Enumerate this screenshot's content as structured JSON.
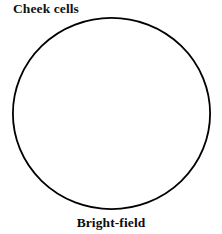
{
  "figure": {
    "canvas": {
      "width": 222,
      "height": 234,
      "background_color": "#ffffff"
    },
    "top_label": "Cheek cells",
    "bottom_label": "Bright-field",
    "specimen": {
      "name": "cheek cells",
      "illumination_technique": "Bright-field"
    },
    "field_of_view": {
      "shape": "circle",
      "stroke_color": "#000000",
      "fill_color": "#ffffff",
      "stroke_width_px": 1.8,
      "center_x": 111.5,
      "center_y": 113.5,
      "radius_x": 99.5,
      "radius_y": 96.5,
      "left_px": 12,
      "right_px": 211,
      "top_px": 17,
      "bottom_px": 210
    }
  }
}
